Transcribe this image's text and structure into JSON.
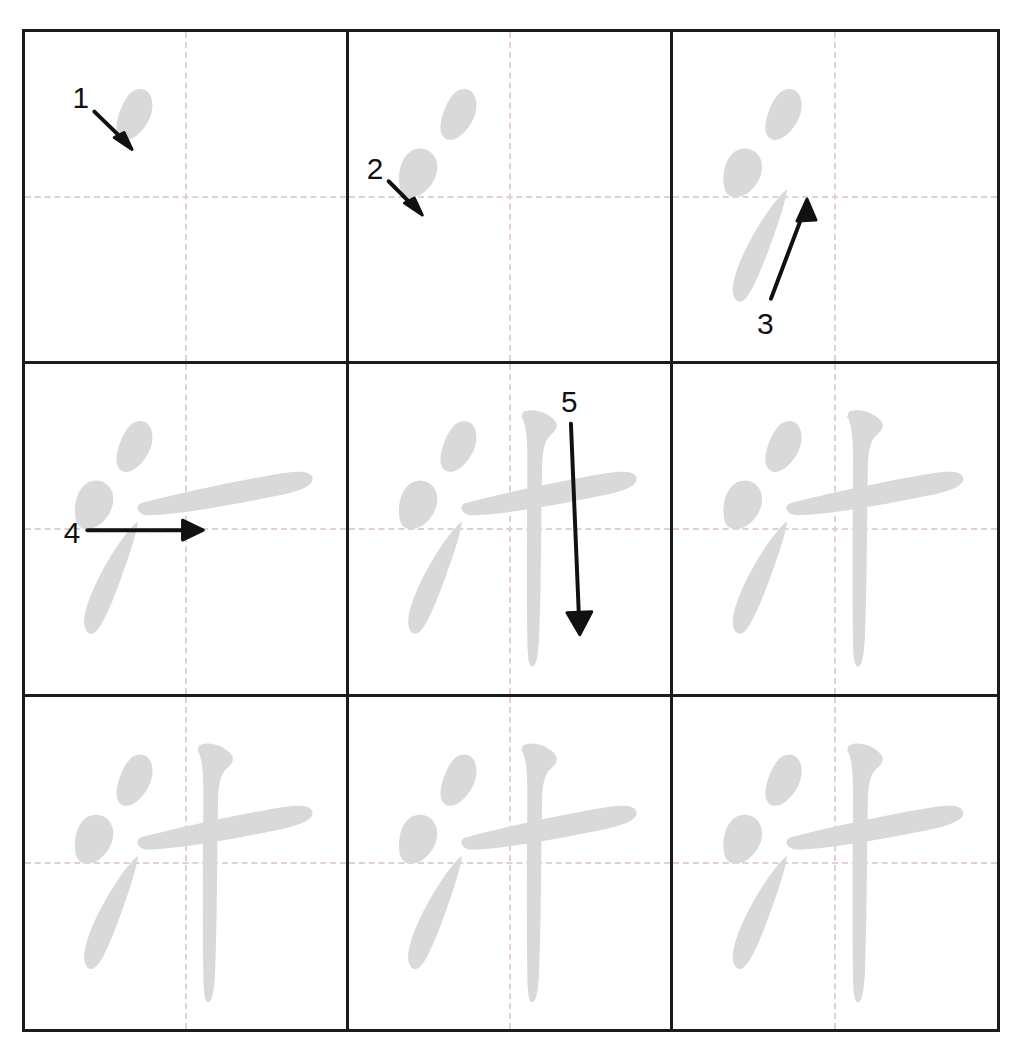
{
  "worksheet": {
    "title": "Chinese character stroke order practice grid",
    "character": "汁",
    "total_strokes": 5,
    "grid_rows": 3,
    "grid_columns": 3,
    "cell_count": 9,
    "colors": {
      "page_background": "#ffffff",
      "grid_border": "#1c1c1c",
      "guide_line": "#e2cfd1",
      "stroke_fill": "#d9d9d9",
      "annotation": "#111111"
    }
  },
  "cells": [
    {
      "index": 1,
      "position": "row1-col1",
      "strokes_shown": 1,
      "annotation": {
        "label": "1",
        "kind": "arrow",
        "direction": "down-right",
        "stroke_name": "dian"
      }
    },
    {
      "index": 2,
      "position": "row1-col2",
      "strokes_shown": 2,
      "annotation": {
        "label": "2",
        "kind": "arrow",
        "direction": "down-right",
        "stroke_name": "dian"
      }
    },
    {
      "index": 3,
      "position": "row1-col3",
      "strokes_shown": 3,
      "annotation": {
        "label": "3",
        "kind": "arrow",
        "direction": "up-right",
        "stroke_name": "tiao"
      }
    },
    {
      "index": 4,
      "position": "row2-col1",
      "strokes_shown": 4,
      "annotation": {
        "label": "4",
        "kind": "arrow",
        "direction": "right",
        "stroke_name": "heng"
      }
    },
    {
      "index": 5,
      "position": "row2-col2",
      "strokes_shown": 5,
      "annotation": {
        "label": "5",
        "kind": "arrow",
        "direction": "down",
        "stroke_name": "shu"
      }
    },
    {
      "index": 6,
      "position": "row2-col3",
      "strokes_shown": 5,
      "annotation": null
    },
    {
      "index": 7,
      "position": "row3-col1",
      "strokes_shown": 5,
      "annotation": null
    },
    {
      "index": 8,
      "position": "row3-col2",
      "strokes_shown": 5,
      "annotation": null
    },
    {
      "index": 9,
      "position": "row3-col3",
      "strokes_shown": 5,
      "annotation": null
    }
  ],
  "stroke_labels": {
    "s1": "1",
    "s2": "2",
    "s3": "3",
    "s4": "4",
    "s5": "5"
  }
}
